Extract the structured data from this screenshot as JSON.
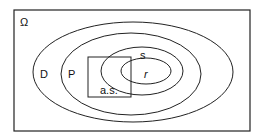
{
  "diagram": {
    "universe_label": "Ω",
    "sets": [
      {
        "id": "D",
        "label": "D"
      },
      {
        "id": "P",
        "label": "P"
      },
      {
        "id": "s",
        "label": "s"
      },
      {
        "id": "r",
        "label": "r"
      }
    ],
    "box_label": "a.s.",
    "colors": {
      "stroke": "#222222",
      "background": "#ffffff"
    }
  }
}
